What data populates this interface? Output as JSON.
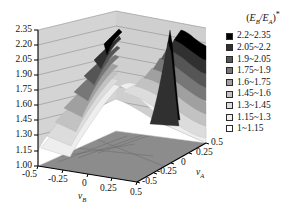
{
  "chart_data": {
    "type": "surface",
    "title": "",
    "xlabel": "νB",
    "ylabel": "νA",
    "zlabel": "(EB/EA)*",
    "grid": true,
    "legend_position": "right",
    "x_ticks": [
      "-0.5",
      "-0.25",
      "0",
      "0.25",
      "0.5"
    ],
    "y_ticks": [
      "0.5",
      "0.25",
      "0",
      "-0.25",
      "-0.5"
    ],
    "z_ticks": [
      "2.35",
      "2.20",
      "2.05",
      "1.90",
      "1.75",
      "1.60",
      "1.45",
      "1.30",
      "1.15",
      "1.00"
    ],
    "zlim": [
      1.0,
      2.35
    ],
    "xlim": [
      -0.5,
      0.5
    ],
    "ylim": [
      -0.5,
      0.5
    ],
    "band_width": 0.15,
    "legend_title": "(EB/EA)*",
    "legend_entries": [
      {
        "label": "2.2~2.35",
        "color": "#000000",
        "range": [
          2.2,
          2.35
        ]
      },
      {
        "label": "2.05~2.2",
        "color": "#303030",
        "range": [
          2.05,
          2.2
        ]
      },
      {
        "label": "1.9~2.05",
        "color": "#555555",
        "range": [
          1.9,
          2.05
        ]
      },
      {
        "label": "1.75~1.9",
        "color": "#777777",
        "range": [
          1.75,
          1.9
        ]
      },
      {
        "label": "1.6~1.75",
        "color": "#a0a0a0",
        "range": [
          1.6,
          1.75
        ]
      },
      {
        "label": "1.45~1.6",
        "color": "#c2c2c2",
        "range": [
          1.45,
          1.6
        ]
      },
      {
        "label": "1.3~1.45",
        "color": "#dcdcdc",
        "range": [
          1.3,
          1.45
        ]
      },
      {
        "label": "1.15~1.3",
        "color": "#eeeeee",
        "range": [
          1.15,
          1.3
        ]
      },
      {
        "label": "1~1.15",
        "color": "#ffffff",
        "range": [
          1.0,
          1.15
        ]
      }
    ]
  },
  "axes": {
    "z": {
      "ticks": [
        "2.35",
        "2.20",
        "2.05",
        "1.90",
        "1.75",
        "1.60",
        "1.45",
        "1.30",
        "1.15",
        "1.00"
      ]
    },
    "x": {
      "name": "ν",
      "sub": "B",
      "ticks": [
        "-0.5",
        "-0.25",
        "0",
        "0.25",
        "0.5"
      ]
    },
    "y": {
      "name": "ν",
      "sub": "A",
      "ticks": [
        "0.5",
        "0.25",
        "0",
        "-0.25",
        "-0.5"
      ]
    }
  },
  "legend": {
    "title_main": "E",
    "title_sub_b": "B",
    "title_slash": "/E",
    "title_sub_a": "A",
    "title_star": "*"
  }
}
